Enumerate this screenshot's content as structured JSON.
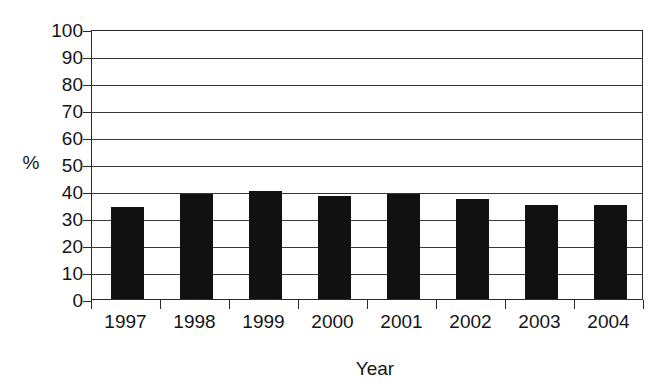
{
  "chart_data": {
    "type": "bar",
    "title": "",
    "subtitle": "",
    "xlabel": "Year",
    "ylabel": "%",
    "categories": [
      "1997",
      "1998",
      "1999",
      "2000",
      "2001",
      "2002",
      "2003",
      "2004"
    ],
    "values": [
      34,
      39,
      40,
      38,
      39,
      37,
      35,
      35
    ],
    "series": [
      {
        "name": "",
        "values": [
          34,
          39,
          40,
          38,
          39,
          37,
          35,
          35
        ]
      }
    ],
    "ylim": [
      0,
      100
    ],
    "ytick_values": [
      0,
      10,
      20,
      30,
      40,
      50,
      60,
      70,
      80,
      90,
      100
    ],
    "ytick_labels": [
      "0",
      "10",
      "20",
      "30",
      "40",
      "50",
      "60",
      "70",
      "80",
      "90",
      "100"
    ],
    "grid": "horizontal",
    "legend": "none",
    "bar_color": "#111111",
    "axis_color": "#2b2b2b",
    "background_color": "#ffffff",
    "annotations": []
  },
  "axes": {
    "y_label": "%",
    "x_label": "Year"
  }
}
